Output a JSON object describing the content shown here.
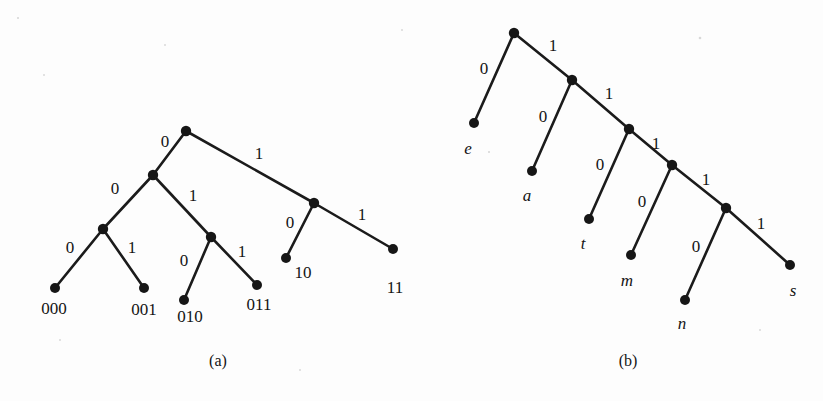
{
  "figure": {
    "background_color": "#fdfdfd",
    "ink_color": "#161616",
    "captions": [
      {
        "text": "(a)",
        "x": 218,
        "y": 362
      },
      {
        "text": "(b)",
        "x": 628,
        "y": 362
      }
    ]
  },
  "chart_data": {
    "type": "diagram",
    "subtype": "binary-code-tree",
    "title": "",
    "panels": [
      {
        "id": "a",
        "caption": "(a)",
        "description": "Fixed-structure binary prefix-code tree with leaf codewords 000, 001, 010, 011, 10, 11",
        "nodes": [
          {
            "id": "a-root",
            "x": 186,
            "y": 131,
            "kind": "internal",
            "label": ""
          },
          {
            "id": "a-n0",
            "x": 153,
            "y": 175,
            "kind": "internal",
            "label": ""
          },
          {
            "id": "a-n00",
            "x": 103,
            "y": 229,
            "kind": "internal",
            "label": ""
          },
          {
            "id": "a-n000",
            "x": 55,
            "y": 288,
            "kind": "leaf",
            "label": "000"
          },
          {
            "id": "a-n001",
            "x": 144,
            "y": 288,
            "kind": "leaf",
            "label": "001"
          },
          {
            "id": "a-n01",
            "x": 211,
            "y": 237,
            "kind": "internal",
            "label": ""
          },
          {
            "id": "a-n010",
            "x": 184,
            "y": 300,
            "kind": "leaf",
            "label": "010"
          },
          {
            "id": "a-n011",
            "x": 257,
            "y": 285,
            "kind": "leaf",
            "label": "011"
          },
          {
            "id": "a-n1",
            "x": 314,
            "y": 203,
            "kind": "internal",
            "label": ""
          },
          {
            "id": "a-n10",
            "x": 286,
            "y": 258,
            "kind": "leaf",
            "label": "10"
          },
          {
            "id": "a-n11",
            "x": 393,
            "y": 249,
            "kind": "leaf",
            "label": "11"
          }
        ],
        "edges": [
          {
            "from": "a-root",
            "to": "a-n0",
            "bit": "0",
            "lx": 165,
            "ly": 143
          },
          {
            "from": "a-root",
            "to": "a-n1",
            "bit": "1",
            "lx": 259,
            "ly": 155
          },
          {
            "from": "a-n0",
            "to": "a-n00",
            "bit": "0",
            "lx": 115,
            "ly": 190
          },
          {
            "from": "a-n0",
            "to": "a-n01",
            "bit": "1",
            "lx": 193,
            "ly": 197
          },
          {
            "from": "a-n00",
            "to": "a-n000",
            "bit": "0",
            "lx": 70,
            "ly": 249
          },
          {
            "from": "a-n00",
            "to": "a-n001",
            "bit": "1",
            "lx": 132,
            "ly": 249
          },
          {
            "from": "a-n01",
            "to": "a-n010",
            "bit": "0",
            "lx": 184,
            "ly": 262
          },
          {
            "from": "a-n01",
            "to": "a-n011",
            "bit": "1",
            "lx": 242,
            "ly": 253
          },
          {
            "from": "a-n1",
            "to": "a-n10",
            "bit": "0",
            "lx": 290,
            "ly": 224
          },
          {
            "from": "a-n1",
            "to": "a-n11",
            "bit": "1",
            "lx": 362,
            "ly": 216
          }
        ],
        "leaf_labels": [
          {
            "text": "000",
            "x": 54,
            "y": 310,
            "italic": false
          },
          {
            "text": "001",
            "x": 144,
            "y": 311,
            "italic": false
          },
          {
            "text": "010",
            "x": 190,
            "y": 318,
            "italic": false
          },
          {
            "text": "011",
            "x": 259,
            "y": 306,
            "italic": false
          },
          {
            "text": "10",
            "x": 303,
            "y": 274,
            "italic": false
          },
          {
            "text": "11",
            "x": 395,
            "y": 289,
            "italic": false
          }
        ],
        "codewords": [
          {
            "symbol": "000",
            "code": "000",
            "depth": 3
          },
          {
            "symbol": "001",
            "code": "001",
            "depth": 3
          },
          {
            "symbol": "010",
            "code": "010",
            "depth": 3
          },
          {
            "symbol": "011",
            "code": "011",
            "depth": 3
          },
          {
            "symbol": "10",
            "code": "10",
            "depth": 2
          },
          {
            "symbol": "11",
            "code": "11",
            "depth": 2
          }
        ]
      },
      {
        "id": "b",
        "caption": "(b)",
        "description": "Degenerate (right-spine) Huffman-style code tree for symbols e, a, t, m, n, s",
        "nodes": [
          {
            "id": "b-root",
            "x": 514,
            "y": 33,
            "kind": "internal",
            "label": ""
          },
          {
            "id": "b-e",
            "x": 474,
            "y": 123,
            "kind": "leaf",
            "label": "e"
          },
          {
            "id": "b-i1",
            "x": 572,
            "y": 80,
            "kind": "internal",
            "label": ""
          },
          {
            "id": "b-a",
            "x": 532,
            "y": 171,
            "kind": "leaf",
            "label": "a"
          },
          {
            "id": "b-i2",
            "x": 629,
            "y": 129,
            "kind": "internal",
            "label": ""
          },
          {
            "id": "b-t",
            "x": 589,
            "y": 219,
            "kind": "leaf",
            "label": "t"
          },
          {
            "id": "b-i3",
            "x": 672,
            "y": 165,
            "kind": "internal",
            "label": ""
          },
          {
            "id": "b-m",
            "x": 631,
            "y": 255,
            "kind": "leaf",
            "label": "m"
          },
          {
            "id": "b-i4",
            "x": 726,
            "y": 208,
            "kind": "internal",
            "label": ""
          },
          {
            "id": "b-n",
            "x": 685,
            "y": 300,
            "kind": "leaf",
            "label": "n"
          },
          {
            "id": "b-s",
            "x": 790,
            "y": 265,
            "kind": "leaf",
            "label": "s"
          }
        ],
        "edges": [
          {
            "from": "b-root",
            "to": "b-e",
            "bit": "0",
            "lx": 484,
            "ly": 70
          },
          {
            "from": "b-root",
            "to": "b-i1",
            "bit": "1",
            "lx": 553,
            "ly": 47
          },
          {
            "from": "b-i1",
            "to": "b-a",
            "bit": "0",
            "lx": 543,
            "ly": 118
          },
          {
            "from": "b-i1",
            "to": "b-i2",
            "bit": "1",
            "lx": 609,
            "ly": 95
          },
          {
            "from": "b-i2",
            "to": "b-t",
            "bit": "0",
            "lx": 600,
            "ly": 166
          },
          {
            "from": "b-i2",
            "to": "b-i3",
            "bit": "1",
            "lx": 656,
            "ly": 145
          },
          {
            "from": "b-i3",
            "to": "b-m",
            "bit": "0",
            "lx": 642,
            "ly": 203
          },
          {
            "from": "b-i3",
            "to": "b-i4",
            "bit": "1",
            "lx": 706,
            "ly": 181
          },
          {
            "from": "b-i4",
            "to": "b-n",
            "bit": "0",
            "lx": 696,
            "ly": 248
          },
          {
            "from": "b-i4",
            "to": "b-s",
            "bit": "1",
            "lx": 761,
            "ly": 225
          }
        ],
        "leaf_labels": [
          {
            "text": "e",
            "x": 468,
            "y": 150,
            "italic": true
          },
          {
            "text": "a",
            "x": 527,
            "y": 197,
            "italic": true
          },
          {
            "text": "t",
            "x": 583,
            "y": 245,
            "italic": true
          },
          {
            "text": "m",
            "x": 627,
            "y": 282,
            "italic": true
          },
          {
            "text": "n",
            "x": 682,
            "y": 325,
            "italic": true
          },
          {
            "text": "s",
            "x": 793,
            "y": 292,
            "italic": true
          }
        ],
        "codewords": [
          {
            "symbol": "e",
            "code": "0",
            "depth": 1
          },
          {
            "symbol": "a",
            "code": "10",
            "depth": 2
          },
          {
            "symbol": "t",
            "code": "110",
            "depth": 3
          },
          {
            "symbol": "m",
            "code": "1110",
            "depth": 4
          },
          {
            "symbol": "n",
            "code": "11110",
            "depth": 5
          },
          {
            "symbol": "s",
            "code": "11111",
            "depth": 5
          }
        ]
      }
    ]
  }
}
